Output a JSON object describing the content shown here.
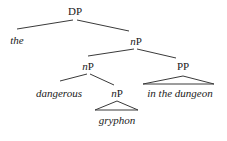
{
  "tree": {
    "root": {
      "category": "DP",
      "children": [
        {
          "word": "the"
        },
        {
          "category_prefix": "n",
          "category_suffix": "P",
          "children": [
            {
              "category_prefix": "n",
              "category_suffix": "P",
              "children": [
                {
                  "word": "dangerous"
                },
                {
                  "category_prefix": "n",
                  "category_suffix": "P",
                  "triangle": true,
                  "word": "gryphon"
                }
              ]
            },
            {
              "category": "PP",
              "triangle": true,
              "word": "in the dungeon"
            }
          ]
        }
      ]
    }
  },
  "labels": {
    "dp": "DP",
    "the": "the",
    "np_top_prefix": "n",
    "np_top_suffix": "P",
    "np_left_prefix": "n",
    "np_left_suffix": "P",
    "pp": "PP",
    "dangerous": "dangerous",
    "np_low_prefix": "n",
    "np_low_suffix": "P",
    "in_the_dungeon": "in the dungeon",
    "gryphon": "gryphon"
  }
}
